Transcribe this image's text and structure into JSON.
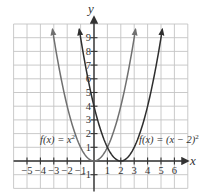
{
  "chart_data": {
    "type": "line",
    "title": "",
    "xlabel": "x",
    "ylabel": "y",
    "xlim": [
      -6,
      7
    ],
    "ylim": [
      -2,
      10
    ],
    "grid": true,
    "x_ticks": [
      -5,
      -4,
      -3,
      -2,
      -1,
      1,
      2,
      3,
      4,
      5,
      6
    ],
    "x_tick_labels": [
      "−5",
      "−4",
      "−3",
      "−2",
      "−1",
      "1",
      "2",
      "3",
      "4",
      "5",
      "6"
    ],
    "y_ticks": [
      -1,
      1,
      2,
      3,
      4,
      5,
      6,
      7,
      8,
      9
    ],
    "y_tick_labels": [
      "−1",
      "1",
      "2",
      "3",
      "4",
      "5",
      "6",
      "7",
      "8",
      "9"
    ],
    "series": [
      {
        "name": "f(x) = x²",
        "label_text": "f(x) = x",
        "label_sup": "2",
        "expression": "x^2",
        "x": [
          -3,
          -2,
          -1,
          0,
          1,
          2,
          3
        ],
        "values": [
          9,
          4,
          1,
          0,
          1,
          4,
          9
        ],
        "color": "#707070",
        "arrows": true
      },
      {
        "name": "f(x) = (x − 2)²",
        "label_text": "f(x) = (x − 2)",
        "label_sup": "2",
        "expression": "(x-2)^2",
        "x": [
          -1,
          0,
          1,
          2,
          3,
          4,
          5
        ],
        "values": [
          9,
          4,
          1,
          0,
          1,
          4,
          9
        ],
        "color": "#2e2e2e",
        "arrows": true
      }
    ]
  },
  "colors": {
    "grid": "#c4c4c4",
    "axis": "#333333",
    "text": "#333333"
  }
}
